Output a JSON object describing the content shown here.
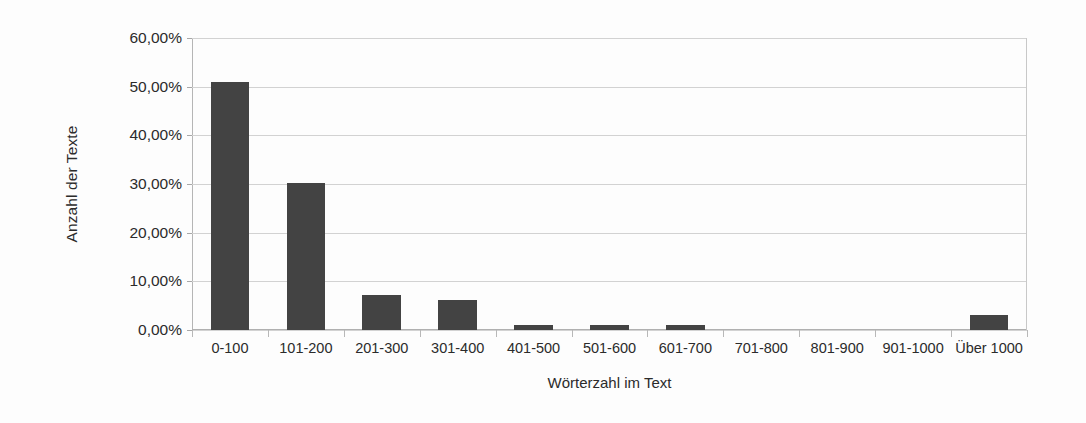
{
  "chart_data": {
    "type": "bar",
    "title": "",
    "subtitle": "",
    "xlabel": "Wörterzahl im Text",
    "ylabel": "Anzahl der Texte",
    "categories": [
      "0-100",
      "101-200",
      "201-300",
      "301-400",
      "401-500",
      "501-600",
      "601-700",
      "701-800",
      "801-900",
      "901-1000",
      "Über 1000"
    ],
    "values": [
      51.0,
      30.3,
      7.2,
      6.1,
      1.1,
      1.1,
      1.1,
      0.0,
      0.0,
      0.0,
      3.0
    ],
    "value_unit": "%",
    "ylim": [
      0,
      60
    ],
    "ytick_values": [
      0,
      10,
      20,
      30,
      40,
      50,
      60
    ],
    "ytick_labels": [
      "0,00%",
      "10,00%",
      "20,00%",
      "30,00%",
      "40,00%",
      "50,00%",
      "60,00%"
    ],
    "grid": true,
    "legend": false,
    "legend_position": "none",
    "bar_color": "#434343",
    "gridline_color": "#d2d2d2",
    "axis_color": "#b0b0b0",
    "background_color": "#fdfdfd",
    "text_color": "#2b2b2b"
  }
}
